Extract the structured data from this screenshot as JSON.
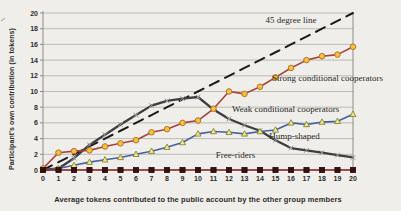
{
  "chart_data": {
    "type": "line",
    "title": "",
    "xlabel": "Average tokens contributed to the public account by the other group members",
    "ylabel": "Participant's own contribution (in tokens)",
    "xlim": [
      0,
      20
    ],
    "ylim": [
      0,
      20
    ],
    "x_ticks": [
      0,
      1,
      2,
      3,
      4,
      5,
      6,
      7,
      8,
      9,
      10,
      11,
      12,
      13,
      14,
      15,
      16,
      17,
      18,
      19,
      20
    ],
    "y_ticks": [
      0,
      2,
      4,
      6,
      8,
      10,
      12,
      14,
      16,
      18,
      20
    ],
    "grid": "horizontal",
    "legend_position": "inline-annotations",
    "x": [
      0,
      1,
      2,
      3,
      4,
      5,
      6,
      7,
      8,
      9,
      10,
      11,
      12,
      13,
      14,
      15,
      16,
      17,
      18,
      19,
      20
    ],
    "series": [
      {
        "name": "45 degree line",
        "style": "dashed",
        "color": "#1b1b1b",
        "width": 2,
        "marker": "none",
        "values": [
          0,
          1,
          2,
          3,
          4,
          5,
          6,
          7,
          8,
          9,
          10,
          11,
          12,
          13,
          14,
          15,
          16,
          17,
          18,
          19,
          20
        ]
      },
      {
        "name": "Hump-shaped",
        "style": "solid",
        "color": "#3e3e40",
        "width": 2.3,
        "marker": "cross",
        "marker_stroke": "#9a9a9a",
        "values": [
          0,
          0.2,
          1.5,
          3.2,
          4.5,
          5.8,
          7.0,
          8.2,
          8.8,
          9.1,
          9.3,
          7.7,
          6.5,
          5.7,
          5.0,
          3.8,
          2.8,
          2.5,
          2.2,
          1.9,
          1.6
        ]
      },
      {
        "name": "Weak conditional cooperators",
        "style": "solid",
        "color": "#45629f",
        "width": 1.6,
        "marker": "triangle",
        "marker_fill": "#f1e78e",
        "marker_stroke": "#85832f",
        "values": [
          0,
          0.2,
          0.6,
          1.0,
          1.3,
          1.6,
          2.0,
          2.4,
          2.9,
          3.5,
          4.6,
          4.9,
          4.8,
          4.6,
          4.9,
          5.1,
          6.0,
          5.8,
          6.1,
          6.2,
          7.1
        ]
      },
      {
        "name": "Strong conditional cooperators",
        "style": "solid",
        "color": "#a8423a",
        "width": 1.6,
        "marker": "circle",
        "marker_fill": "#f2c23c",
        "marker_stroke": "#ad6b28",
        "values": [
          0.2,
          2.2,
          2.4,
          2.5,
          3.0,
          3.4,
          3.8,
          4.8,
          5.2,
          6.0,
          6.3,
          7.8,
          10.0,
          9.7,
          10.6,
          11.8,
          13.0,
          14.0,
          14.5,
          14.7,
          15.7
        ]
      },
      {
        "name": "Free-riders",
        "style": "solid",
        "color": "#8a2a26",
        "width": 1.4,
        "marker": "square",
        "marker_fill": "#38100f",
        "marker_stroke": "#240a0a",
        "values": [
          0,
          0,
          0,
          0,
          0,
          0,
          0,
          0,
          0,
          0,
          0,
          0,
          0,
          0,
          0,
          0,
          0,
          0,
          0,
          0,
          0
        ]
      }
    ],
    "annotations": [
      {
        "text": "45 degree line",
        "x": 14.35,
        "y": 18.7
      },
      {
        "text": "Strong conditional cooperators",
        "x": 14.78,
        "y": 11.4
      },
      {
        "text": "Weak conditional cooperators",
        "x": 12.2,
        "y": 7.35
      },
      {
        "text": "Hump-shaped",
        "x": 14.6,
        "y": 3.95
      },
      {
        "text": "Free-riders",
        "x": 11.15,
        "y": 1.5
      }
    ],
    "colors": {
      "background": "#f0eeea",
      "grid": "#b6b4ae",
      "axis": "#8f8d87",
      "text": "#2e2c28",
      "annotation_text": "#2b2a26"
    }
  }
}
